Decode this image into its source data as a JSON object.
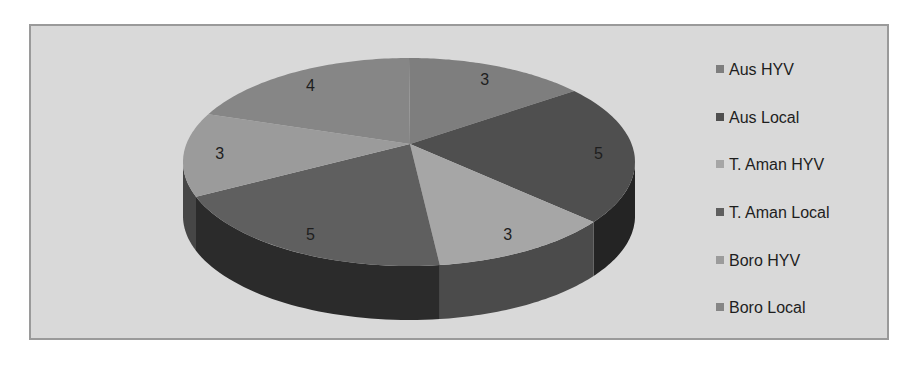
{
  "chart_data": {
    "type": "pie",
    "style": "3d-pie",
    "title": "",
    "categories": [
      "Aus HYV",
      "Aus Local",
      "T. Aman HYV",
      "T. Aman Local",
      "Boro HYV",
      "Boro Local"
    ],
    "values": [
      3,
      5,
      3,
      5,
      3,
      4
    ],
    "data_labels": [
      "3",
      "5",
      "3",
      "5",
      "3",
      "4"
    ],
    "colors": [
      "#7e7e7e",
      "#4f4f4f",
      "#a6a6a6",
      "#5f5f5f",
      "#9b9b9b",
      "#868686"
    ],
    "legend_position": "right",
    "start_angle": "12 o'clock, clockwise"
  },
  "legend": {
    "items": [
      {
        "label": "Aus HYV",
        "color": "#7e7e7e"
      },
      {
        "label": "Aus Local",
        "color": "#4f4f4f"
      },
      {
        "label": "T. Aman HYV",
        "color": "#a6a6a6"
      },
      {
        "label": "T. Aman Local",
        "color": "#5f5f5f"
      },
      {
        "label": "Boro HYV",
        "color": "#9b9b9b"
      },
      {
        "label": "Boro Local",
        "color": "#868686"
      }
    ]
  }
}
